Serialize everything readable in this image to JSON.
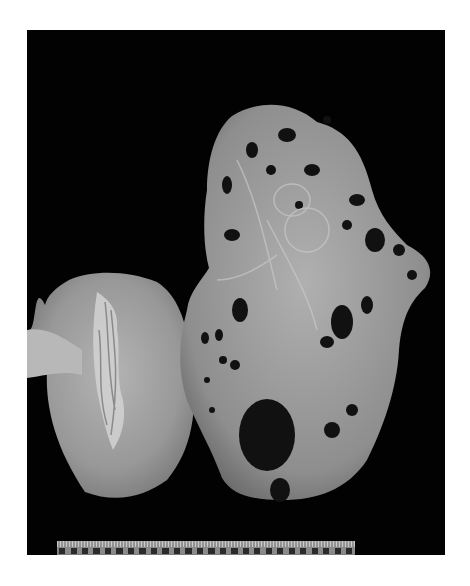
{
  "image": {
    "description": "Grayscale gross pathology photograph on black background: a normal-sized bisected kidney (left) beside a markedly enlarged polycystic kidney (right) with numerous cysts, and a scale ruler along the bottom edge",
    "background_color": "#020202",
    "page_color": "#ffffff"
  },
  "specimens": [
    {
      "name": "normal-kidney",
      "position": "left",
      "shade": "#a9a9a9"
    },
    {
      "name": "polycystic-kidney",
      "position": "right",
      "shade": "#9c9c9c"
    }
  ],
  "ruler": {
    "position": "bottom",
    "segments": 27
  }
}
